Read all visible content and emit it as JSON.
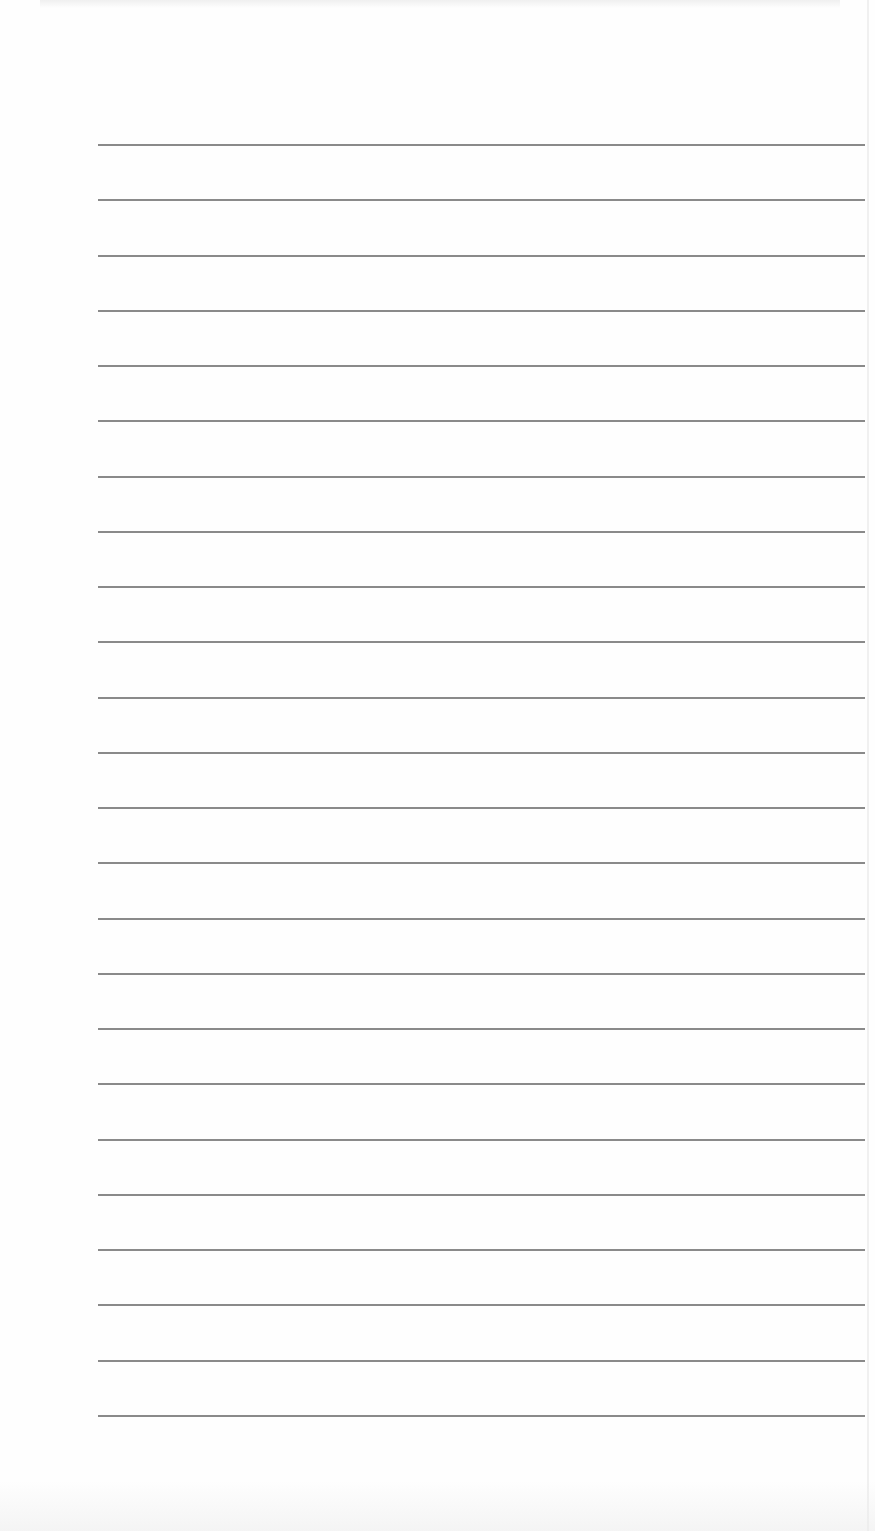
{
  "document": {
    "type": "lined-notepaper",
    "background_color": "#fefefe",
    "rule_color": "#8a8a8a",
    "rule_count": 24,
    "rule_left_px": 98,
    "rule_right_px": 865,
    "rule_thickness_px": 2,
    "first_rule_y_px": 145,
    "last_rule_y_px": 1416,
    "rule_spacing_px": 55.26,
    "content_text": ""
  }
}
